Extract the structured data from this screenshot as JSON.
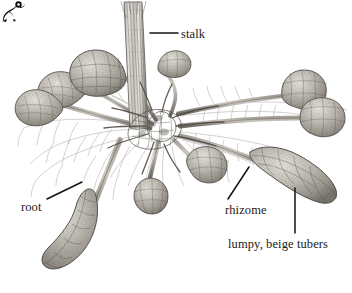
{
  "figure": {
    "style": "pen-and-ink stipple and hatching, grayscale",
    "background_color": "#ffffff",
    "ink_color": "#1c1a18",
    "tuber_color": "#9a968e",
    "tuber_highlight": "#d8d4cc",
    "root_color": "#6e6a64"
  },
  "ornament": {
    "name": "corner-flourish",
    "color": "#101010"
  },
  "labels": [
    {
      "id": "stalk",
      "text": "stalk",
      "leader": "horizontal"
    },
    {
      "id": "root",
      "text": "root",
      "leader": "diagonal-up-right"
    },
    {
      "id": "rhizome",
      "text": "rhizome",
      "leader": "diagonal-up-right"
    },
    {
      "id": "tubers",
      "text": "lumpy, beige tubers",
      "leader": "vertical"
    }
  ],
  "plant": {
    "stalk": {
      "description": "vertical fibrous stem rising from crown"
    },
    "crown": {
      "description": "dense tangled mass of roots at center"
    },
    "tuber_count": 9,
    "rhizome_count": 9
  }
}
